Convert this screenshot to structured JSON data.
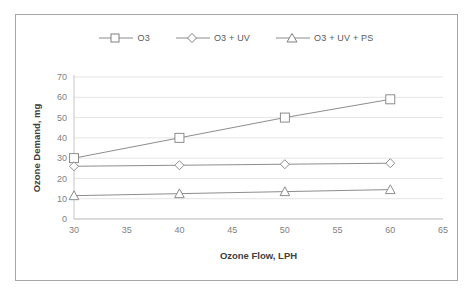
{
  "chart_data": {
    "type": "line",
    "title": "",
    "xlabel": "Ozone Flow, LPH",
    "ylabel": "Ozone Demand, mg",
    "x": [
      30,
      40,
      50,
      60
    ],
    "xlim": [
      30,
      65
    ],
    "ylim": [
      0,
      70
    ],
    "xticks": [
      30,
      35,
      40,
      45,
      50,
      55,
      60,
      65
    ],
    "yticks": [
      0,
      10,
      20,
      30,
      40,
      50,
      60,
      70
    ],
    "xtick_labels": [
      "30",
      "35",
      "40",
      "45",
      "50",
      "55",
      "60",
      "65"
    ],
    "ytick_labels": [
      "0",
      "10",
      "20",
      "30",
      "40",
      "50",
      "60",
      "70"
    ],
    "grid": "horizontal",
    "legend_position": "top-center",
    "series": [
      {
        "name": "O3",
        "marker": "square",
        "color": "#808080",
        "values": [
          30,
          40,
          50,
          59
        ]
      },
      {
        "name": "O3 + UV",
        "marker": "diamond",
        "color": "#808080",
        "values": [
          26,
          26.5,
          27,
          27.5
        ]
      },
      {
        "name": "O3 + UV + PS",
        "marker": "triangle",
        "color": "#808080",
        "values": [
          11.5,
          12.5,
          13.5,
          14.5
        ]
      }
    ]
  },
  "legend": {
    "entries": [
      {
        "label": "O3",
        "marker": "square-marker-icon"
      },
      {
        "label": "O3 + UV",
        "marker": "diamond-marker-icon"
      },
      {
        "label": "O3 + UV + PS",
        "marker": "triangle-marker-icon"
      }
    ]
  },
  "axes": {
    "x_title": "Ozone Flow, LPH",
    "y_title": "Ozone Demand, mg",
    "x_ticks": [
      "30",
      "35",
      "40",
      "45",
      "50",
      "55",
      "60",
      "65"
    ],
    "y_ticks": [
      "0",
      "10",
      "20",
      "30",
      "40",
      "50",
      "60",
      "70"
    ]
  }
}
